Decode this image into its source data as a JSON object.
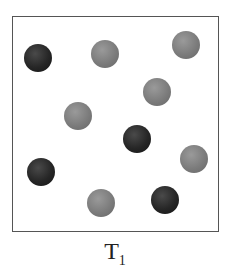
{
  "diagram": {
    "label": "T",
    "label_subscript": "1",
    "particles": [
      {
        "type": "dark",
        "cx": 38,
        "cy": 58
      },
      {
        "type": "light",
        "cx": 105,
        "cy": 54
      },
      {
        "type": "light",
        "cx": 186,
        "cy": 45
      },
      {
        "type": "light",
        "cx": 157,
        "cy": 92
      },
      {
        "type": "light",
        "cx": 78,
        "cy": 116
      },
      {
        "type": "dark",
        "cx": 137,
        "cy": 139
      },
      {
        "type": "light",
        "cx": 194,
        "cy": 159
      },
      {
        "type": "dark",
        "cx": 41,
        "cy": 172
      },
      {
        "type": "light",
        "cx": 101,
        "cy": 203
      },
      {
        "type": "dark",
        "cx": 165,
        "cy": 200
      }
    ],
    "colors": {
      "dark": "#1e1e1e",
      "light": "#7c7c7c",
      "border": "#555555"
    }
  }
}
